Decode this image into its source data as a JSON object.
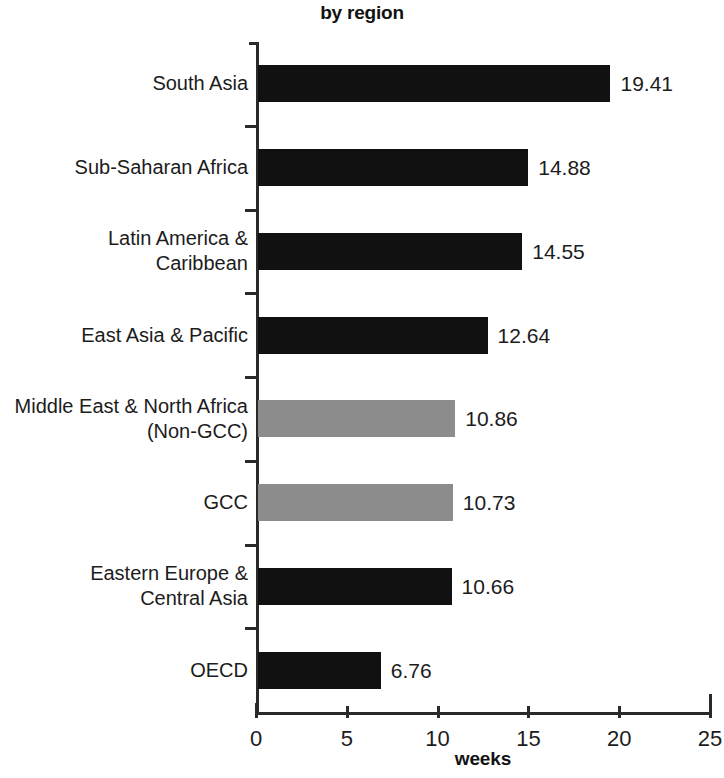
{
  "chart_data": {
    "type": "bar",
    "orientation": "horizontal",
    "title": "by region",
    "xlabel": "weeks",
    "ylabel": "",
    "xlim": [
      0,
      25
    ],
    "xticks": [
      "0",
      "5",
      "10",
      "15",
      "20",
      "25"
    ],
    "grid": false,
    "legend": null,
    "categories": [
      "South Asia",
      "Sub-Saharan Africa",
      "Latin America &\nCaribbean",
      "East Asia & Pacific",
      "Middle East & North Africa\n(Non-GCC)",
      "GCC",
      "Eastern Europe &\nCentral Asia",
      "OECD"
    ],
    "values": [
      19.41,
      14.88,
      14.55,
      12.64,
      10.86,
      10.73,
      10.66,
      6.76
    ],
    "value_labels": [
      "19.41",
      "14.88",
      "14.55",
      "12.64",
      "10.86",
      "10.73",
      "10.66",
      "6.76"
    ],
    "bar_colors": [
      "dark",
      "dark",
      "dark",
      "dark",
      "light",
      "light",
      "dark",
      "dark"
    ],
    "colors": {
      "dark": "#111111",
      "light": "#8c8c8c",
      "axis": "#2a2a2a",
      "text": "#1c1c1c",
      "background": "#ffffff"
    }
  }
}
